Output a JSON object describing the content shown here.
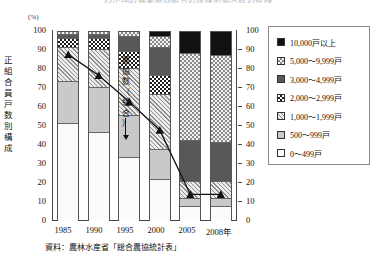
{
  "title_clipped": "わが国の農業協同組合の規模別組合数の推移",
  "axis": {
    "unit": "(%)",
    "y_caption": [
      "正",
      "組",
      "合",
      "員",
      "戸",
      "数",
      "別",
      "構",
      "成"
    ],
    "y_ticks": [
      100,
      90,
      80,
      70,
      60,
      50,
      40,
      30,
      20,
      10,
      0
    ],
    "y_ticks_right": [
      100,
      90,
      80,
      70,
      60,
      50,
      40,
      30,
      20,
      10,
      0
    ],
    "x_labels": [
      "1985",
      "1990",
      "1995",
      "2000",
      "2005",
      "2008年"
    ]
  },
  "annotation": {
    "text": [
      "農",
      "協",
      "数",
      "（",
      "組",
      "合",
      "）"
    ],
    "arrow": "down-arrow"
  },
  "legend": {
    "items": [
      {
        "label": "10,000戸以上",
        "pattern": "solid-black",
        "color": "#111111"
      },
      {
        "label": "5,000〜9,999戸",
        "pattern": "check-large",
        "color": "#8a8a8a"
      },
      {
        "label": "3,000〜4,999戸",
        "pattern": "solid-dkgray",
        "color": "#585858"
      },
      {
        "label": "2,000〜2,999戸",
        "pattern": "check-dark",
        "color": "#1d1d1d"
      },
      {
        "label": "1,000〜1,999戸",
        "pattern": "hatch-diag",
        "color": "#8f8f8f"
      },
      {
        "label": "500〜999戸",
        "pattern": "solid-ltgray",
        "color": "#c9c9c9"
      },
      {
        "label": "0〜499戸",
        "pattern": "solid-white",
        "color": "#fbfbfb"
      }
    ]
  },
  "source": "資料：農林水産省「総合農協統計表」",
  "chart_data": {
    "type": "bar",
    "title": "わが国の農業協同組合の規模別組合数の推移",
    "xlabel": "",
    "ylabel": "正組合員戸数別構成",
    "ylim": [
      0,
      100
    ],
    "unit": "%",
    "grid": false,
    "legend_position": "right-outside",
    "stacked": true,
    "categories": [
      "1985",
      "1990",
      "1995",
      "2000",
      "2005",
      "2008"
    ],
    "series": [
      {
        "name": "0〜499戸",
        "values": [
          52,
          47,
          34,
          22,
          8,
          8
        ]
      },
      {
        "name": "500〜999戸",
        "values": [
          22,
          24,
          22,
          16,
          4,
          4
        ]
      },
      {
        "name": "1,000〜1,999戸",
        "values": [
          18,
          20,
          25,
          29,
          9,
          9
        ]
      },
      {
        "name": "2,000〜2,999戸",
        "values": [
          5,
          6,
          9,
          10,
          0,
          0
        ]
      },
      {
        "name": "3,000〜4,999戸",
        "values": [
          2,
          2,
          8,
          15,
          22,
          21
        ]
      },
      {
        "name": "5,000〜9,999戸",
        "values": [
          1,
          1,
          2,
          6,
          46,
          46
        ]
      },
      {
        "name": "10,000戸以上",
        "values": [
          0,
          0,
          0,
          2,
          11,
          12
        ]
      }
    ],
    "overlay_line": {
      "name": "農協数（組合）",
      "marker": "filled-triangle",
      "values": [
        87,
        76,
        62,
        47,
        13,
        13
      ]
    }
  }
}
